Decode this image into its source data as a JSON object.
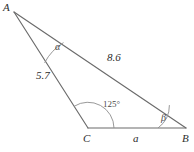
{
  "figure": {
    "background_color": "#ffffff",
    "line_color": "#6b6b6b",
    "text_color": "#2e2e2e"
  },
  "vertices": [
    {
      "name": "A",
      "label": "A",
      "x": 14,
      "y": 12,
      "label_x": 3,
      "label_y": 2
    },
    {
      "name": "C",
      "label": "C",
      "x": 88,
      "y": 128,
      "label_x": 83,
      "label_y": 133
    },
    {
      "name": "B",
      "label": "B",
      "x": 186,
      "y": 128,
      "label_x": 182,
      "label_y": 133
    }
  ],
  "sides": [
    {
      "name": "side-AB",
      "label": "8.6",
      "from": "A",
      "to": "B",
      "label_x": 107,
      "label_y": 52
    },
    {
      "name": "side-AC",
      "label": "5.7",
      "from": "A",
      "to": "C",
      "label_x": 36,
      "label_y": 70
    },
    {
      "name": "side-CB",
      "label": "a",
      "from": "C",
      "to": "B",
      "label_x": 133,
      "label_y": 133
    }
  ],
  "angles": [
    {
      "name": "angle-A",
      "label": "α",
      "at": "A",
      "label_x": 55,
      "label_y": 42
    },
    {
      "name": "angle-C",
      "label": "125",
      "degree_symbol": "°",
      "at": "C",
      "label_x": 103,
      "label_y": 100
    },
    {
      "name": "angle-B",
      "label": "β",
      "at": "B",
      "label_x": 161,
      "label_y": 113
    }
  ]
}
